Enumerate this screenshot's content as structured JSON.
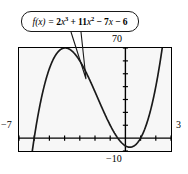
{
  "figure": {
    "callout": {
      "label": "f(x) = 2x^3 + 11x^2 - 7x - 6",
      "fn_name": "f",
      "fn_var": "(x)",
      "equals": "=",
      "term1_coef": "2",
      "term1_var": "x",
      "term1_exp": "3",
      "plus1": "+",
      "term2_coef": "11",
      "term2_var": "x",
      "term2_exp": "2",
      "minus1": "−",
      "term3_coef": "7",
      "term3_var": "x",
      "minus2": "−",
      "term4": "6"
    },
    "window": {
      "xmin_label": "−7",
      "xmax_label": "3",
      "ymax_label": "70",
      "ymin_label": "−10"
    }
  },
  "chart_data": {
    "type": "line",
    "xlabel": "",
    "ylabel": "",
    "xlim": [
      -7,
      3
    ],
    "ylim": [
      -10,
      70
    ],
    "grid": false,
    "legend": null,
    "axis_tick_spacing": {
      "x": 1,
      "y": 10
    },
    "equation": "y = 2x^3 + 11x^2 - 7x - 6",
    "coefficients": {
      "a": 2,
      "b": 11,
      "c": -7,
      "d": -6
    },
    "roots": [
      -6,
      -0.5,
      1
    ],
    "series": [
      {
        "name": "f(x) = 2x^3 + 11x^2 - 7x - 6",
        "x": [
          -7,
          -6.6,
          -6.2,
          -6.0,
          -5.6,
          -5.2,
          -4.8,
          -4.4,
          -4.0,
          -3.6,
          -3.2,
          -2.8,
          -2.4,
          -2.0,
          -1.6,
          -1.2,
          -0.8,
          -0.5,
          -0.2,
          0.2,
          0.6,
          1.0,
          1.4,
          1.8,
          2.2,
          2.6,
          3.0
        ],
        "y": [
          -146.0,
          -95.6,
          -51.3,
          -32.0,
          0.9,
          28.6,
          51.3,
          69.2,
          82.0,
          90.1,
          86.9,
          83.5,
          69.7,
          52.0,
          32.4,
          13.4,
          -3.7,
          -9.0,
          -10.2,
          -6.9,
          2.0,
          20.0,
          48.2,
          88.1,
          140.5,
          206.0,
          285.0
        ]
      }
    ]
  }
}
